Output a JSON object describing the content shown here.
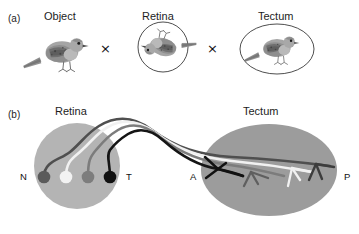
{
  "figure": {
    "background": "#ffffff",
    "panels": [
      {
        "id": "a",
        "id_label": "(a)",
        "items": [
          {
            "label": "Object",
            "shape": "none",
            "content": "bird-upright"
          },
          {
            "label": "Retina",
            "shape": "circle",
            "content": "bird-inverted-rotated"
          },
          {
            "label": "Tectum",
            "shape": "ellipse",
            "content": "bird-upright"
          }
        ],
        "operators": [
          "×",
          "×"
        ]
      },
      {
        "id": "b",
        "id_label": "(b)",
        "retina": {
          "label": "Retina",
          "fill": "#b3b3b3",
          "axis_labels": {
            "left": "N",
            "right": "T"
          },
          "ganglion_cells": [
            {
              "name": "cell-N-dark-gray",
              "color": "#5a5a5a"
            },
            {
              "name": "cell-white",
              "color": "#f2f2f2"
            },
            {
              "name": "cell-mid-gray",
              "color": "#7d7d7d"
            },
            {
              "name": "cell-T-black",
              "color": "#111111"
            }
          ]
        },
        "tectum": {
          "label": "Tectum",
          "fill": "#9a9a9a",
          "axis_labels": {
            "left": "A",
            "right": "P"
          },
          "terminal_arbors": [
            {
              "name": "arbor-black",
              "color": "#111111"
            },
            {
              "name": "arbor-mid-gray",
              "color": "#5f5f5f"
            },
            {
              "name": "arbor-white",
              "color": "#f2f2f2"
            },
            {
              "name": "arbor-dark-gray",
              "color": "#3d3d3d"
            }
          ]
        },
        "optic_tract": {
          "name": "axon-bundle",
          "fiber_colors": [
            "#4a4a4a",
            "#f2f2f2",
            "#7a7a7a",
            "#151515"
          ]
        }
      }
    ]
  }
}
